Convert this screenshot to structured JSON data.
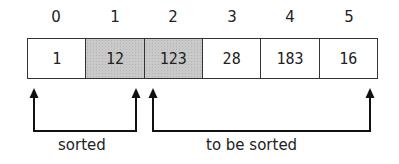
{
  "diagram": {
    "indices": [
      "0",
      "1",
      "2",
      "3",
      "4",
      "5"
    ],
    "cells": [
      {
        "value": "1",
        "shaded": false
      },
      {
        "value": "12",
        "shaded": true
      },
      {
        "value": "123",
        "shaded": true
      },
      {
        "value": "28",
        "shaded": false
      },
      {
        "value": "183",
        "shaded": false
      },
      {
        "value": "16",
        "shaded": false
      }
    ],
    "brackets": {
      "sorted_label": "sorted",
      "unsorted_label": "to be sorted"
    },
    "colors": {
      "shaded_cell": "#c9c9c9",
      "border": "#333333",
      "arrow": "#111111"
    }
  }
}
